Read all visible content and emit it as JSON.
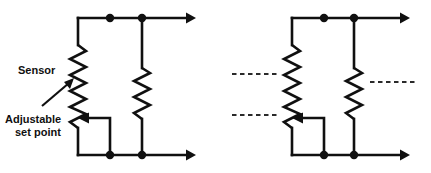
{
  "diagram": {
    "type": "schematic",
    "title": "",
    "background_color": "#ffffff",
    "line_color": "#101010",
    "dash_color": "#2a2a2a",
    "labels": {
      "sensor": "Sensor",
      "set_point_line1": "Adjustable",
      "set_point_line2": "set point"
    },
    "panels": [
      {
        "id": "left-circuit",
        "name": "sensor-setpoint-divider-labeled",
        "has_labels": true,
        "has_dashed_continuations": false,
        "components": {
          "sensor_resistor": "zigzag-resistor",
          "fixed_resistor": "zigzag-resistor",
          "wiper": "adjustable-wiper-arrow",
          "top_rail_terminal": "arrow-terminal-right",
          "bottom_rail_terminal": "arrow-terminal-right",
          "junction_dots": 4
        }
      },
      {
        "id": "right-circuit",
        "name": "sensor-setpoint-divider-continuation",
        "has_labels": false,
        "has_dashed_continuations": true,
        "dashed_lines": 3,
        "components": {
          "sensor_resistor": "zigzag-resistor",
          "fixed_resistor": "zigzag-resistor",
          "wiper": "adjustable-wiper-arrow",
          "top_rail_terminal": "arrow-terminal-right",
          "bottom_rail_terminal": "arrow-terminal-right",
          "junction_dots": 4
        }
      }
    ]
  }
}
